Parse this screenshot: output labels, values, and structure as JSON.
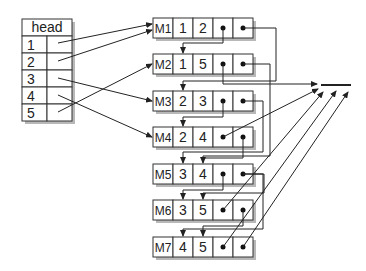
{
  "head_table": {
    "title": "head",
    "rows": [
      "1",
      "2",
      "3",
      "4",
      "5"
    ],
    "pointers": {
      "1": "M1",
      "2": "M1",
      "3": "M3",
      "4": "M4",
      "5": "M2"
    }
  },
  "nodes": [
    {
      "id": "M1",
      "label": "M1",
      "v1": "1",
      "v2": "2"
    },
    {
      "id": "M2",
      "label": "M2",
      "v1": "1",
      "v2": "5"
    },
    {
      "id": "M3",
      "label": "M3",
      "v1": "2",
      "v2": "3"
    },
    {
      "id": "M4",
      "label": "M4",
      "v1": "2",
      "v2": "4"
    },
    {
      "id": "M5",
      "label": "M5",
      "v1": "3",
      "v2": "4"
    },
    {
      "id": "M6",
      "label": "M6",
      "v1": "3",
      "v2": "5"
    },
    {
      "id": "M7",
      "label": "M7",
      "v1": "4",
      "v2": "5"
    }
  ],
  "null_marker": "null",
  "colors": {
    "stroke": "#222222",
    "shadow": "#b8b8b8",
    "background": "#ffffff"
  }
}
